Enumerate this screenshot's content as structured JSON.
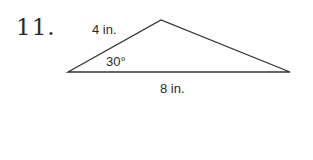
{
  "problem": {
    "number": "11."
  },
  "figure": {
    "shape": "triangle",
    "vertices": {
      "left": [
        68,
        72
      ],
      "top": [
        161,
        20
      ],
      "right": [
        290,
        72
      ]
    },
    "labels": {
      "side_left": "4 in.",
      "angle_left": "30°",
      "side_bottom": "8 in."
    },
    "stroke_color": "#333333"
  }
}
